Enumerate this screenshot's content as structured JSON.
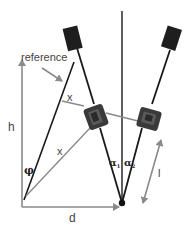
{
  "diagram": {
    "labels": {
      "reference": "reference",
      "h": "h",
      "d": "d",
      "x_upper": "x",
      "x_lower": "x",
      "phi": "φ",
      "alpha1": "α",
      "alpha1_sub": "1",
      "alpha2": "α",
      "alpha2_sub": "2",
      "l": "l"
    },
    "colors": {
      "black_line": "#1a1a1a",
      "gray_line": "#8a8a8a",
      "device": "#2b2b2b",
      "background": "#ffffff"
    }
  }
}
